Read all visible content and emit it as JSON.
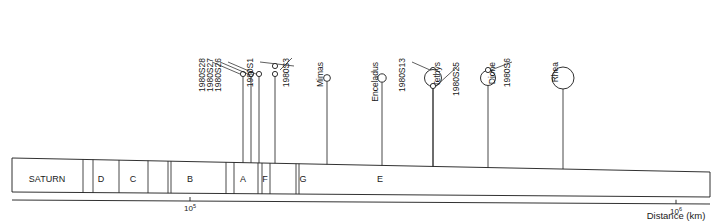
{
  "diagram": {
    "planet_label": "SATURN",
    "axis": {
      "label": "Distance (km)",
      "ticks": [
        {
          "value": "10",
          "exponent": "5",
          "x": 190
        },
        {
          "value": "10",
          "exponent": "6",
          "x": 676
        }
      ]
    },
    "rings": [
      {
        "label": "D",
        "x": 101
      },
      {
        "label": "C",
        "x": 133
      },
      {
        "label": "B",
        "x": 190
      },
      {
        "label": "A",
        "x": 243
      },
      {
        "label": "F",
        "x": 265
      },
      {
        "label": "G",
        "x": 303
      },
      {
        "label": "E",
        "x": 380
      }
    ],
    "moons": [
      {
        "name": "1980S28",
        "x": 243,
        "r": 2.6,
        "label_x": 205,
        "label_y": 58,
        "leader": [
          [
            212,
            62
          ],
          [
            240,
            74
          ]
        ]
      },
      {
        "name": "1980S27",
        "x": 251,
        "r": 2.6,
        "label_x": 213,
        "label_y": 58,
        "leader": [
          [
            220,
            62
          ],
          [
            248,
            74
          ]
        ]
      },
      {
        "name": "1980S26",
        "x": 259,
        "r": 2.6,
        "label_x": 221,
        "label_y": 58,
        "leader": [
          [
            228,
            62
          ],
          [
            256,
            74
          ]
        ]
      },
      {
        "name": "1980S1",
        "x": 275,
        "r": 2.6,
        "label_x": 253,
        "label_y": 58,
        "leader": [
          [
            260,
            62
          ],
          [
            294,
            66
          ]
        ]
      },
      {
        "name": "1980S3",
        "x": 275,
        "r": 2.6,
        "label_x": 289,
        "label_y": 58,
        "leader": [
          [
            292,
            58
          ],
          [
            280,
            70
          ]
        ]
      },
      {
        "name": "Mimas",
        "x": 327,
        "r": 3.4,
        "label_x": 323,
        "label_y": 62
      },
      {
        "name": "Enceladus",
        "x": 382,
        "r": 4.2,
        "label_x": 378,
        "label_y": 62
      },
      {
        "name": "1980S13",
        "x": 433,
        "r": 2.6,
        "label_x": 405,
        "label_y": 58,
        "leader": [
          [
            412,
            62
          ],
          [
            430,
            70
          ]
        ]
      },
      {
        "name": "Tethys",
        "x": 433,
        "r": 8.5,
        "label_x": 440,
        "label_y": 62
      },
      {
        "name": "1980S25",
        "x": 433,
        "r": 2.6,
        "label_x": 459,
        "label_y": 62,
        "leader": [
          [
            458,
            66
          ],
          [
            436,
            86
          ]
        ]
      },
      {
        "name": "Dione",
        "x": 488,
        "r": 7.5,
        "label_x": 495,
        "label_y": 62
      },
      {
        "name": "1980S6",
        "x": 488,
        "r": 2.6,
        "label_x": 510,
        "label_y": 58,
        "leader": [
          [
            512,
            62
          ],
          [
            491,
            70
          ]
        ]
      },
      {
        "name": "Rhea",
        "x": 563,
        "r": 11.0,
        "label_x": 558,
        "label_y": 62
      }
    ]
  },
  "colors": {
    "ink": "#1a1a1a",
    "paper": "#ffffff"
  }
}
